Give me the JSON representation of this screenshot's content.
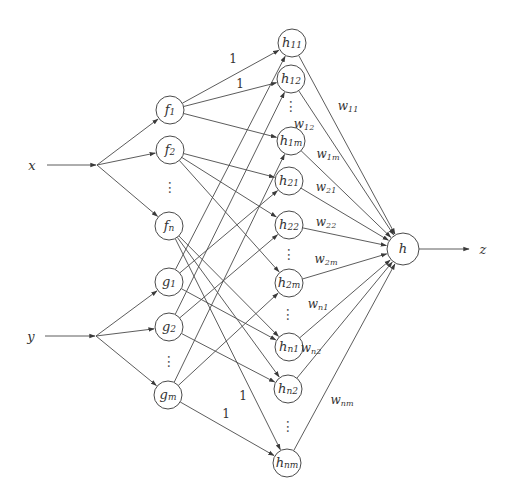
{
  "diagram": {
    "type": "neural-network-graph",
    "inputs": [
      {
        "id": "x",
        "label": "x"
      },
      {
        "id": "y",
        "label": "y"
      }
    ],
    "layer_f": [
      {
        "id": "f1",
        "base": "f",
        "sub": "1"
      },
      {
        "id": "f2",
        "base": "f",
        "sub": "2"
      },
      {
        "id": "fn",
        "base": "f",
        "sub": "n"
      }
    ],
    "layer_g": [
      {
        "id": "g1",
        "base": "g",
        "sub": "1"
      },
      {
        "id": "g2",
        "base": "g",
        "sub": "2"
      },
      {
        "id": "gm",
        "base": "g",
        "sub": "m"
      }
    ],
    "layer_h": [
      {
        "id": "h11",
        "base": "h",
        "sub": "11"
      },
      {
        "id": "h12",
        "base": "h",
        "sub": "12"
      },
      {
        "id": "h1m",
        "base": "h",
        "sub": "1m"
      },
      {
        "id": "h21",
        "base": "h",
        "sub": "21"
      },
      {
        "id": "h22",
        "base": "h",
        "sub": "22"
      },
      {
        "id": "h2m",
        "base": "h",
        "sub": "2m"
      },
      {
        "id": "hn1",
        "base": "h",
        "sub": "n1"
      },
      {
        "id": "hn2",
        "base": "h",
        "sub": "n2"
      },
      {
        "id": "hnm",
        "base": "h",
        "sub": "nm"
      }
    ],
    "output_node": {
      "id": "h",
      "label": "h"
    },
    "output": {
      "id": "z",
      "label": "z"
    },
    "ellipsis": "⋮",
    "edges_f_to_h": [
      {
        "from": "f1",
        "to": [
          "h11",
          "h12",
          "h1m"
        ]
      },
      {
        "from": "f2",
        "to": [
          "h21",
          "h22",
          "h2m"
        ]
      },
      {
        "from": "fn",
        "to": [
          "hn1",
          "hn2",
          "hnm"
        ]
      }
    ],
    "edges_g_to_h": [
      {
        "from": "g1",
        "to": [
          "h11",
          "h21",
          "hn1"
        ]
      },
      {
        "from": "g2",
        "to": [
          "h12",
          "h22",
          "hn2"
        ]
      },
      {
        "from": "gm",
        "to": [
          "h1m",
          "h2m",
          "hnm"
        ]
      }
    ],
    "unit_weight_labels": [
      {
        "edge": "f1-h11",
        "text": "1"
      },
      {
        "edge": "f1-h12",
        "text": "1"
      },
      {
        "edge": "fn-hnm",
        "text": "1"
      },
      {
        "edge": "gm-hnm",
        "text": "1"
      }
    ],
    "weights": [
      {
        "from": "h11",
        "base": "w",
        "sub": "11"
      },
      {
        "from": "h12",
        "base": "w",
        "sub": "12"
      },
      {
        "from": "h1m",
        "base": "w",
        "sub": "1m"
      },
      {
        "from": "h21",
        "base": "w",
        "sub": "21"
      },
      {
        "from": "h22",
        "base": "w",
        "sub": "22"
      },
      {
        "from": "h2m",
        "base": "w",
        "sub": "2m"
      },
      {
        "from": "hn1",
        "base": "w",
        "sub": "n1"
      },
      {
        "from": "hn2",
        "base": "w",
        "sub": "n2"
      },
      {
        "from": "hnm",
        "base": "w",
        "sub": "nm"
      }
    ]
  }
}
